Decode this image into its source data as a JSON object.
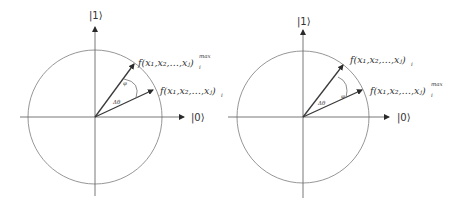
{
  "diagrams": [
    {
      "id": "left",
      "axis_labels": {
        "vertical": "|1⟩",
        "horizontal": "|0⟩"
      },
      "vectors": [
        {
          "role": "max",
          "label_main": "f(x₁,x₂,…,xⱼ)",
          "label_sub": "i",
          "label_sup": "max"
        },
        {
          "role": "current",
          "label_main": "f(x₁,x₂,…,xⱼ)",
          "label_sub": "i",
          "label_sup": ""
        }
      ],
      "angle_label": "Δθ",
      "arc_mark": "φ"
    },
    {
      "id": "right",
      "axis_labels": {
        "vertical": "|1⟩",
        "horizontal": "|0⟩"
      },
      "vectors": [
        {
          "role": "current",
          "label_main": "f(x₁,x₂,…,xⱼ)",
          "label_sub": "i",
          "label_sup": ""
        },
        {
          "role": "max",
          "label_main": "f(x₁,x₂,…,xⱼ)",
          "label_sub": "i",
          "label_sup": "max"
        }
      ],
      "angle_label": "Δθ",
      "arc_mark": "φ"
    }
  ]
}
